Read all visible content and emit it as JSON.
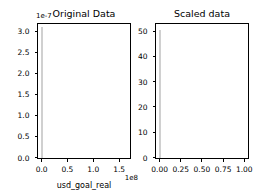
{
  "figure": {
    "width": 272,
    "height": 196,
    "background": "#ffffff",
    "foreground": "#000000",
    "bar_color": "#e8e8e8",
    "bar_edge_color": "#d0d0d0"
  },
  "chart_data": [
    {
      "type": "bar",
      "name": "original-data",
      "title": "Original Data",
      "xlabel": "usd_goal_real",
      "ylabel": "",
      "y_offset_text": "1e-7",
      "x_offset_text": "1e8",
      "xticklabels": [
        "0.0",
        "0.5",
        "1.0",
        "1.5"
      ],
      "xtickvalues": [
        0.0,
        0.5,
        1.0,
        1.5
      ],
      "yticklabels": [
        "0.0",
        "0.5",
        "1.0",
        "1.5",
        "2.0",
        "2.5",
        "3.0"
      ],
      "ytickvalues": [
        0.0,
        0.5,
        1.0,
        1.5,
        2.0,
        2.5,
        3.0
      ],
      "xlim": [
        -0.06,
        1.72
      ],
      "ylim": [
        0.0,
        3.18
      ],
      "grid": false,
      "legend": null,
      "categories": [
        "0.0"
      ],
      "values": [
        3.1
      ],
      "bars": [
        {
          "x": 0.0,
          "width": 0.035,
          "height": 3.1
        }
      ]
    },
    {
      "type": "bar",
      "name": "scaled-data",
      "title": "Scaled data",
      "xlabel": "",
      "ylabel": "",
      "y_offset_text": "",
      "x_offset_text": "",
      "xticklabels": [
        "0.00",
        "0.25",
        "0.50",
        "0.75",
        "1.00"
      ],
      "xtickvalues": [
        0.0,
        0.25,
        0.5,
        0.75,
        1.0
      ],
      "yticklabels": [
        "0",
        "10",
        "20",
        "30",
        "40",
        "50"
      ],
      "ytickvalues": [
        0,
        10,
        20,
        30,
        40,
        50
      ],
      "xlim": [
        -0.037,
        1.05
      ],
      "ylim": [
        0.0,
        53.0
      ],
      "grid": false,
      "legend": null,
      "categories": [
        "0.00"
      ],
      "values": [
        50.5
      ],
      "bars": [
        {
          "x": 0.0,
          "width": 0.022,
          "height": 50.5
        }
      ]
    }
  ]
}
